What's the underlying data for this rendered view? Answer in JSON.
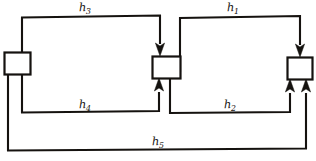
{
  "diagram": {
    "style": {
      "line_color": "#15120f",
      "background": "#ffffff",
      "block_fill": "#ffffff"
    },
    "blocks": [
      {
        "id": "left-block",
        "label": ""
      },
      {
        "id": "middle-block",
        "label": ""
      },
      {
        "id": "right-block",
        "label": ""
      }
    ],
    "labels": [
      {
        "id": "h3",
        "base": "h",
        "sub": "3"
      },
      {
        "id": "h1",
        "base": "h",
        "sub": "1"
      },
      {
        "id": "h4",
        "base": "h",
        "sub": "4"
      },
      {
        "id": "h2",
        "base": "h",
        "sub": "2"
      },
      {
        "id": "h5",
        "base": "h",
        "sub": "5"
      }
    ],
    "paths": [
      {
        "id": "h3",
        "from": "left-block",
        "to": "middle-block",
        "route": "top",
        "direction": "rightward-then-down"
      },
      {
        "id": "h1",
        "from": "middle-block",
        "to": "right-block",
        "route": "top",
        "direction": "rightward-then-down"
      },
      {
        "id": "h4",
        "from": "left-block",
        "to": "middle-block",
        "route": "bottom",
        "direction": "rightward-then-up"
      },
      {
        "id": "h2",
        "from": "middle-block",
        "to": "right-block",
        "route": "bottom",
        "direction": "rightward-then-up"
      },
      {
        "id": "h5",
        "from": "left-block",
        "to": "right-block",
        "route": "outer-bottom",
        "direction": "rightward-then-up"
      }
    ]
  }
}
